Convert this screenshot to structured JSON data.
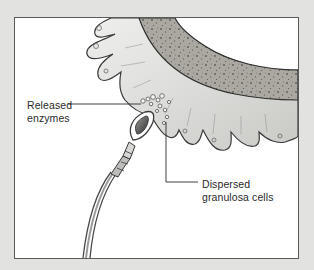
{
  "diagram": {
    "type": "labeled-illustration",
    "labels": [
      {
        "id": "released-enzymes",
        "lines": [
          "Released",
          "enzymes"
        ]
      },
      {
        "id": "dispersed-granulosa-cells",
        "lines": [
          "Dispersed",
          "granulosa cells"
        ]
      }
    ]
  },
  "colors": {
    "page_background": "#e2e2e0",
    "frame_background": "#ffffff",
    "frame_border": "#5a5a5a",
    "egg_membrane": "#a9a79f",
    "granulosa_cells": "#e4e4e2",
    "outline": "#3a3a3a",
    "label_text": "#2a2a2a"
  }
}
